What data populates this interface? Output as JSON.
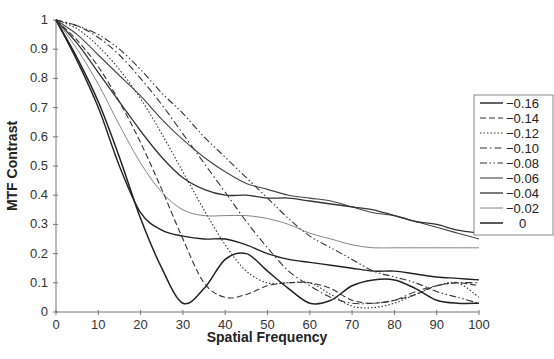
{
  "chart_data": {
    "type": "line",
    "title": "",
    "xlabel": "Spatial Frequency",
    "ylabel": "MTF Contrast",
    "xlim": [
      0,
      100
    ],
    "ylim": [
      0,
      1
    ],
    "xticks": [
      0,
      10,
      20,
      30,
      40,
      50,
      60,
      70,
      80,
      90,
      100
    ],
    "yticks": [
      0,
      0.1,
      0.2,
      0.3,
      0.4,
      0.5,
      0.6,
      0.7,
      0.8,
      0.9,
      1
    ],
    "ytick_labels": [
      "0",
      "0.1",
      "0.2",
      "0.3",
      "0.4",
      "0.5",
      "0.6",
      "0.7",
      "0.8",
      "0.9",
      "1"
    ],
    "grid": false,
    "legend_position": "right",
    "x": [
      0,
      5,
      10,
      15,
      20,
      25,
      30,
      35,
      40,
      45,
      50,
      55,
      60,
      65,
      70,
      75,
      80,
      85,
      90,
      95,
      100
    ],
    "series": [
      {
        "name": "−0.16",
        "style": "solid",
        "values": [
          1,
          0.86,
          0.7,
          0.5,
          0.34,
          0.28,
          0.26,
          0.25,
          0.25,
          0.23,
          0.2,
          0.18,
          0.17,
          0.16,
          0.15,
          0.14,
          0.14,
          0.13,
          0.12,
          0.115,
          0.11
        ]
      },
      {
        "name": "−0.14",
        "style": "dashed",
        "values": [
          1,
          0.93,
          0.84,
          0.72,
          0.58,
          0.42,
          0.25,
          0.1,
          0.05,
          0.06,
          0.09,
          0.1,
          0.1,
          0.08,
          0.04,
          0.03,
          0.04,
          0.06,
          0.09,
          0.1,
          0.09
        ]
      },
      {
        "name": "−0.12",
        "style": "dotted",
        "values": [
          1,
          0.97,
          0.91,
          0.83,
          0.73,
          0.61,
          0.48,
          0.35,
          0.23,
          0.14,
          0.1,
          0.1,
          0.1,
          0.06,
          0.02,
          0.015,
          0.03,
          0.06,
          0.09,
          0.1,
          0.05
        ]
      },
      {
        "name": "−0.10",
        "style": "dashdot",
        "values": [
          1,
          0.98,
          0.94,
          0.88,
          0.8,
          0.71,
          0.61,
          0.51,
          0.41,
          0.31,
          0.22,
          0.14,
          0.09,
          0.05,
          0.03,
          0.03,
          0.04,
          0.07,
          0.09,
          0.1,
          0.1
        ]
      },
      {
        "name": "−0.08",
        "style": "dashdotdot",
        "values": [
          1,
          0.98,
          0.95,
          0.9,
          0.83,
          0.75,
          0.68,
          0.6,
          0.53,
          0.46,
          0.39,
          0.32,
          0.26,
          0.22,
          0.18,
          0.14,
          0.12,
          0.1,
          0.07,
          0.05,
          0.03
        ]
      },
      {
        "name": "−0.06",
        "style": "solid",
        "values": [
          1,
          0.95,
          0.88,
          0.81,
          0.74,
          0.66,
          0.59,
          0.53,
          0.48,
          0.44,
          0.42,
          0.4,
          0.39,
          0.38,
          0.36,
          0.34,
          0.33,
          0.31,
          0.29,
          0.27,
          0.25
        ]
      },
      {
        "name": "−0.04",
        "style": "solid",
        "values": [
          1,
          0.92,
          0.82,
          0.72,
          0.62,
          0.53,
          0.46,
          0.42,
          0.4,
          0.4,
          0.39,
          0.39,
          0.38,
          0.37,
          0.36,
          0.35,
          0.33,
          0.31,
          0.3,
          0.28,
          0.27
        ]
      },
      {
        "name": "−0.02",
        "style": "solid",
        "values": [
          1,
          0.9,
          0.78,
          0.64,
          0.51,
          0.41,
          0.35,
          0.33,
          0.33,
          0.33,
          0.32,
          0.3,
          0.27,
          0.25,
          0.23,
          0.22,
          0.22,
          0.22,
          0.22,
          0.22,
          0.22
        ]
      },
      {
        "name": "0",
        "style": "solid",
        "values": [
          1,
          0.87,
          0.72,
          0.53,
          0.32,
          0.15,
          0.03,
          0.08,
          0.18,
          0.2,
          0.14,
          0.08,
          0.03,
          0.04,
          0.09,
          0.11,
          0.11,
          0.08,
          0.04,
          0.03,
          0.03
        ]
      }
    ]
  }
}
